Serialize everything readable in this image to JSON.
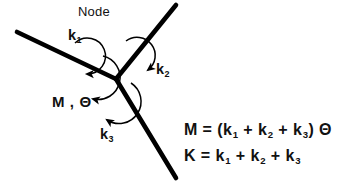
{
  "figure": {
    "background_color": "#ffffff",
    "line_color": "#000000",
    "text_color": "#111111",
    "node_label": "Node",
    "moment_rotation_label": "M , Θ",
    "members": [
      {
        "name": "member-k1",
        "label_main": "k",
        "label_sub": "1"
      },
      {
        "name": "member-k2",
        "label_main": "k",
        "label_sub": "2"
      },
      {
        "name": "member-k3",
        "label_main": "k",
        "label_sub": "3"
      }
    ],
    "equations": [
      {
        "name": "moment",
        "lhs": "M",
        "eq": "=",
        "rhs_open": "(k",
        "s1": "1",
        "plus1": "+ k",
        "s2": "2",
        "plus2": "+ k",
        "s3": "3",
        "rhs_close": ")",
        "trailing": "Θ",
        "plain": "M = (k1 + k2 + k3) Θ"
      },
      {
        "name": "stiffness",
        "lhs": "K",
        "eq": "=",
        "rhs_open": "k",
        "s1": "1",
        "plus1": "+ k",
        "s2": "2",
        "plus2": "+ k",
        "s3": "3",
        "rhs_close": "",
        "trailing": "",
        "plain": "K = k1 + k2 + k3"
      }
    ]
  }
}
